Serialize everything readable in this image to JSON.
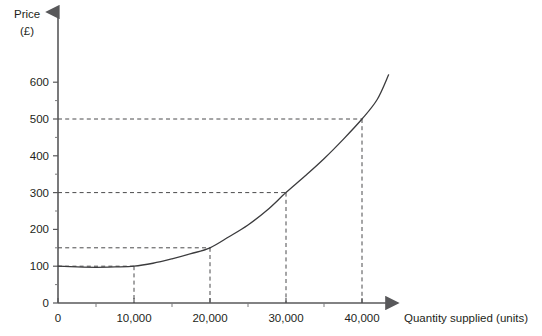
{
  "chart_data": {
    "type": "line",
    "title": "",
    "xlabel": "Quantity supplied (units)",
    "ylabel": "Price (£)",
    "ylabel_line1": "Price",
    "ylabel_line2": "(£)",
    "grid": false,
    "legend": "none",
    "xlim": [
      0,
      45000
    ],
    "ylim": [
      0,
      650
    ],
    "x_ticks": [
      0,
      10000,
      20000,
      30000,
      40000
    ],
    "x_tick_labels": [
      "0",
      "10,000",
      "20,000",
      "30,000",
      "40,000"
    ],
    "x_minor_ticks": [
      5000,
      15000,
      25000,
      35000
    ],
    "y_ticks": [
      0,
      100,
      200,
      300,
      400,
      500,
      600
    ],
    "y_tick_labels": [
      "0",
      "100",
      "200",
      "300",
      "400",
      "500",
      "600"
    ],
    "y_minor_ticks": [
      50,
      150,
      250,
      350,
      450,
      550
    ],
    "series": [
      {
        "name": "Supply curve",
        "x": [
          0,
          2500,
          5000,
          7500,
          10000,
          12500,
          15000,
          17500,
          20000,
          22500,
          25000,
          27500,
          30000,
          32500,
          35000,
          37500,
          40000,
          42000,
          43500
        ],
        "y": [
          100,
          98,
          97,
          98,
          100,
          108,
          120,
          134,
          150,
          180,
          212,
          252,
          300,
          345,
          392,
          444,
          500,
          553,
          620
        ]
      }
    ],
    "annotations": [
      {
        "label": "guide",
        "x": 10000,
        "y": 100
      },
      {
        "label": "guide",
        "x": 20000,
        "y": 150
      },
      {
        "label": "guide",
        "x": 30000,
        "y": 300
      },
      {
        "label": "guide",
        "x": 40000,
        "y": 500
      }
    ]
  }
}
